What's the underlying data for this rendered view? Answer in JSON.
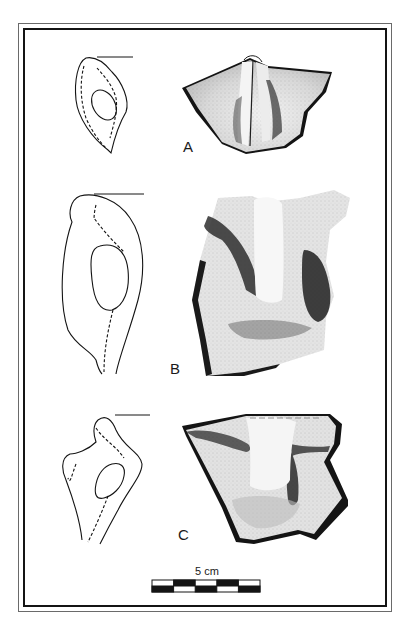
{
  "figure": {
    "type": "archaeological illustration plate",
    "frame": {
      "style": "double-line border",
      "outer_color": "#6a6a6a",
      "inner_color": "#141414"
    },
    "specimens": [
      {
        "label": "A",
        "views": [
          "profile section with dashed inner contour",
          "stippled exterior view of lug with vertical ridge"
        ]
      },
      {
        "label": "B",
        "views": [
          "profile section with dashed inner contour",
          "stippled exterior view of strap handle"
        ]
      },
      {
        "label": "C",
        "views": [
          "profile section with dashed inner contour",
          "stippled exterior view of handle fragment"
        ]
      }
    ],
    "scale_bar": {
      "label": "5 cm",
      "segments": 5,
      "style": "alternating black/white checker, two rows"
    }
  },
  "colors": {
    "ink": "#141414",
    "stipple_dark": "#2a2a2a",
    "stipple_mid": "#9a9a9a",
    "paper": "#ffffff"
  }
}
